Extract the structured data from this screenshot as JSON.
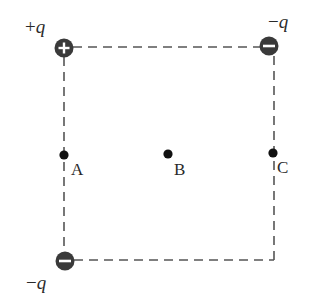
{
  "diagram": {
    "type": "square-charge-configuration",
    "colors": {
      "line": "#555555",
      "charge_fill": "#3a3a3a",
      "charge_symbol": "#ffffff",
      "point": "#111111",
      "text": "#2a2a2a"
    },
    "square": {
      "left": 64,
      "top": 47,
      "right": 274,
      "bottom": 260,
      "style": "dashed"
    },
    "charges": [
      {
        "id": "top-left",
        "sign": "+",
        "label_sign": "+",
        "label_var": "q",
        "symbol": "plus",
        "cx": 64,
        "cy": 48
      },
      {
        "id": "top-right",
        "sign": "-",
        "label_sign": "−",
        "label_var": "q",
        "symbol": "minus",
        "cx": 269,
        "cy": 46
      },
      {
        "id": "bottom-left",
        "sign": "-",
        "label_sign": "−",
        "label_var": "q",
        "symbol": "minus",
        "cx": 65,
        "cy": 261
      }
    ],
    "points": [
      {
        "id": "A",
        "label": "A",
        "cx": 64,
        "cy": 155
      },
      {
        "id": "B",
        "label": "B",
        "cx": 168,
        "cy": 154
      },
      {
        "id": "C",
        "label": "C",
        "cx": 273,
        "cy": 153
      }
    ]
  }
}
